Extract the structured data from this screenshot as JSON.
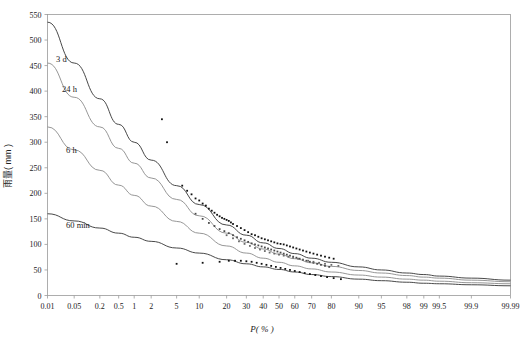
{
  "chart_data": {
    "type": "line",
    "title": "",
    "xlabel": "P( % )",
    "ylabel": "雨量( mm )",
    "grid": false,
    "legend_position": "inline-curve-labels",
    "x_scale": "probability",
    "x_ticks": [
      "0.01",
      "0.05",
      "0.2",
      "0.5",
      "1",
      "2",
      "5",
      "10",
      "20",
      "30",
      "40",
      "50",
      "60",
      "70",
      "80",
      "90",
      "95",
      "98",
      "99",
      "99.5",
      "99.9",
      "99.99"
    ],
    "x_tick_values": [
      0.01,
      0.05,
      0.2,
      0.5,
      1,
      2,
      5,
      10,
      20,
      30,
      40,
      50,
      60,
      70,
      80,
      90,
      95,
      98,
      99,
      99.5,
      99.9,
      99.99
    ],
    "y_ticks": [
      0,
      50,
      100,
      150,
      200,
      250,
      300,
      350,
      400,
      450,
      500,
      550
    ],
    "ylim": [
      0,
      550
    ],
    "series": [
      {
        "name": "3 d",
        "label": "3 d",
        "color": "#333333",
        "x": [
          0.01,
          0.05,
          0.2,
          0.5,
          1,
          2,
          5,
          10,
          20,
          30,
          40,
          50,
          60,
          70,
          80,
          90,
          95,
          98,
          99,
          99.5,
          99.9,
          99.99
        ],
        "values": [
          535,
          455,
          385,
          335,
          300,
          265,
          215,
          178,
          138,
          118,
          103,
          92,
          82,
          73,
          65,
          56,
          50,
          44,
          41,
          38,
          34,
          30
        ]
      },
      {
        "name": "24 h",
        "label": "24 h",
        "color": "#8a8a8a",
        "x": [
          0.01,
          0.05,
          0.2,
          0.5,
          1,
          2,
          5,
          10,
          20,
          30,
          40,
          50,
          60,
          70,
          80,
          90,
          95,
          98,
          99,
          99.5,
          99.9,
          99.99
        ],
        "values": [
          455,
          388,
          330,
          288,
          259,
          230,
          188,
          156,
          122,
          104,
          91,
          81,
          72,
          64,
          57,
          49,
          44,
          39,
          36,
          34,
          30,
          27
        ]
      },
      {
        "name": "6 h",
        "label": "6 h",
        "color": "#8a8a8a",
        "x": [
          0.01,
          0.05,
          0.2,
          0.5,
          1,
          2,
          5,
          10,
          20,
          30,
          40,
          50,
          60,
          70,
          80,
          90,
          95,
          98,
          99,
          99.5,
          99.9,
          99.99
        ],
        "values": [
          330,
          285,
          245,
          216,
          196,
          175,
          145,
          122,
          97,
          83,
          73,
          65,
          58,
          52,
          46,
          40,
          36,
          32,
          30,
          28,
          25,
          23
        ]
      },
      {
        "name": "60 min",
        "label": "60 min",
        "color": "#333333",
        "x": [
          0.01,
          0.05,
          0.2,
          0.5,
          1,
          2,
          5,
          10,
          20,
          30,
          40,
          50,
          60,
          70,
          80,
          90,
          95,
          98,
          99,
          99.5,
          99.9,
          99.99
        ],
        "values": [
          160,
          146,
          132,
          122,
          114,
          106,
          93,
          83,
          70,
          62,
          56,
          51,
          46,
          41,
          37,
          32,
          29,
          26,
          24,
          23,
          21,
          19
        ]
      }
    ],
    "scatter": [
      {
        "name": "3 d observed",
        "color": "#111111",
        "points": [
          [
            3,
            345
          ],
          [
            3.6,
            300
          ],
          [
            6,
            215
          ],
          [
            7,
            205
          ],
          [
            8,
            198
          ],
          [
            9,
            190
          ],
          [
            10,
            186
          ],
          [
            11,
            180
          ],
          [
            12,
            176
          ],
          [
            13,
            170
          ],
          [
            14,
            166
          ],
          [
            15,
            162
          ],
          [
            16,
            158
          ],
          [
            17,
            155
          ],
          [
            18,
            152
          ],
          [
            19,
            150
          ],
          [
            20,
            148
          ],
          [
            21,
            146
          ],
          [
            22,
            143
          ],
          [
            23,
            140
          ],
          [
            25,
            136
          ],
          [
            27,
            132
          ],
          [
            29,
            128
          ],
          [
            31,
            124
          ],
          [
            33,
            120
          ],
          [
            35,
            118
          ],
          [
            37,
            115
          ],
          [
            39,
            112
          ],
          [
            41,
            110
          ],
          [
            43,
            108
          ],
          [
            45,
            106
          ],
          [
            47,
            104
          ],
          [
            49,
            102
          ],
          [
            51,
            101
          ],
          [
            53,
            100
          ],
          [
            55,
            98
          ],
          [
            57,
            96
          ],
          [
            59,
            94
          ],
          [
            61,
            92
          ],
          [
            63,
            90
          ],
          [
            65,
            88
          ],
          [
            67,
            86
          ],
          [
            69,
            84
          ],
          [
            71,
            82
          ],
          [
            73,
            80
          ],
          [
            75,
            78
          ],
          [
            77,
            76
          ],
          [
            79,
            74
          ],
          [
            81,
            72
          ]
        ]
      },
      {
        "name": "24 h observed",
        "color": "#4a4a4a",
        "points": [
          [
            9,
            160
          ],
          [
            11,
            150
          ],
          [
            13,
            142
          ],
          [
            15,
            136
          ],
          [
            17,
            130
          ],
          [
            19,
            126
          ],
          [
            21,
            122
          ],
          [
            23,
            118
          ],
          [
            25,
            114
          ],
          [
            27,
            111
          ],
          [
            29,
            108
          ],
          [
            31,
            105
          ],
          [
            33,
            102
          ],
          [
            35,
            100
          ],
          [
            37,
            98
          ],
          [
            39,
            96
          ],
          [
            41,
            94
          ],
          [
            43,
            92
          ],
          [
            45,
            90
          ],
          [
            47,
            88
          ],
          [
            49,
            86
          ],
          [
            51,
            84
          ],
          [
            53,
            82
          ],
          [
            55,
            80
          ],
          [
            57,
            78
          ],
          [
            59,
            76
          ],
          [
            61,
            74
          ],
          [
            63,
            72
          ],
          [
            65,
            70
          ],
          [
            67,
            68
          ],
          [
            69,
            66
          ],
          [
            71,
            64
          ],
          [
            73,
            62
          ],
          [
            75,
            60
          ],
          [
            77,
            58
          ],
          [
            79,
            56
          ]
        ]
      },
      {
        "name": "6 h observed",
        "color": "#6a6a6a",
        "points": [
          [
            20,
            118
          ],
          [
            23,
            112
          ],
          [
            26,
            106
          ],
          [
            29,
            101
          ],
          [
            32,
            97
          ],
          [
            35,
            93
          ],
          [
            38,
            90
          ],
          [
            41,
            87
          ],
          [
            44,
            84
          ],
          [
            47,
            82
          ],
          [
            50,
            80
          ],
          [
            53,
            78
          ],
          [
            56,
            76
          ],
          [
            59,
            74
          ],
          [
            62,
            72
          ],
          [
            65,
            70
          ],
          [
            68,
            68
          ],
          [
            71,
            66
          ],
          [
            74,
            64
          ],
          [
            77,
            62
          ],
          [
            80,
            60
          ],
          [
            83,
            58
          ]
        ]
      },
      {
        "name": "60 min observed",
        "color": "#111111",
        "points": [
          [
            5,
            62
          ],
          [
            11,
            64
          ],
          [
            17,
            66
          ],
          [
            21,
            68
          ],
          [
            24,
            68
          ],
          [
            27,
            68
          ],
          [
            30,
            67
          ],
          [
            33,
            66
          ],
          [
            36,
            64
          ],
          [
            39,
            62
          ],
          [
            42,
            60
          ],
          [
            45,
            58
          ],
          [
            48,
            56
          ],
          [
            51,
            54
          ],
          [
            54,
            52
          ],
          [
            57,
            50
          ],
          [
            60,
            48
          ],
          [
            63,
            46
          ],
          [
            66,
            44
          ],
          [
            69,
            42
          ],
          [
            72,
            40
          ],
          [
            75,
            38
          ],
          [
            78,
            36
          ],
          [
            81,
            34
          ],
          [
            84,
            32
          ]
        ]
      }
    ],
    "curve_annotations": [
      {
        "label": "3 d",
        "x_px": 56,
        "y_px": 62
      },
      {
        "label": "24 h",
        "x_px": 62,
        "y_px": 92
      },
      {
        "label": "6 h",
        "x_px": 66,
        "y_px": 153
      },
      {
        "label": "60 min",
        "x_px": 66,
        "y_px": 228
      }
    ]
  }
}
